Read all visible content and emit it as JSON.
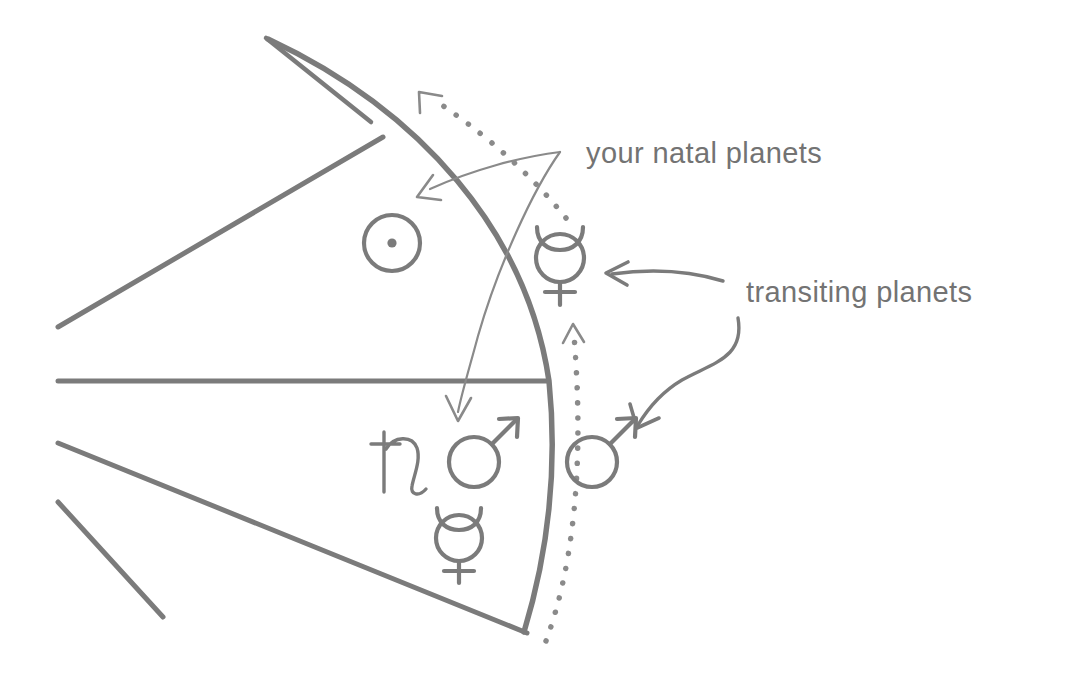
{
  "diagram": {
    "background_color": "#ffffff",
    "stroke_color": "#7b7b7b",
    "text_color": "#737373",
    "annotations": {
      "natal_label": "your natal planets",
      "transit_label": "transiting planets"
    },
    "natal_planets": [
      {
        "name": "sun",
        "symbol": "☉",
        "position": "upper house"
      },
      {
        "name": "saturn",
        "symbol": "♄",
        "position": "lower house"
      },
      {
        "name": "mars",
        "symbol": "♂",
        "position": "lower house"
      },
      {
        "name": "mercury",
        "symbol": "☿",
        "position": "lower house"
      }
    ],
    "transiting_planets": [
      {
        "name": "mercury",
        "symbol": "☿",
        "position": "outside upper arc"
      },
      {
        "name": "mars",
        "symbol": "♂",
        "position": "outside lower arc"
      }
    ],
    "icon_names": [
      "sun-icon",
      "saturn-icon",
      "mars-icon",
      "mercury-icon",
      "arrow-icon",
      "dotted-arc-icon"
    ]
  }
}
